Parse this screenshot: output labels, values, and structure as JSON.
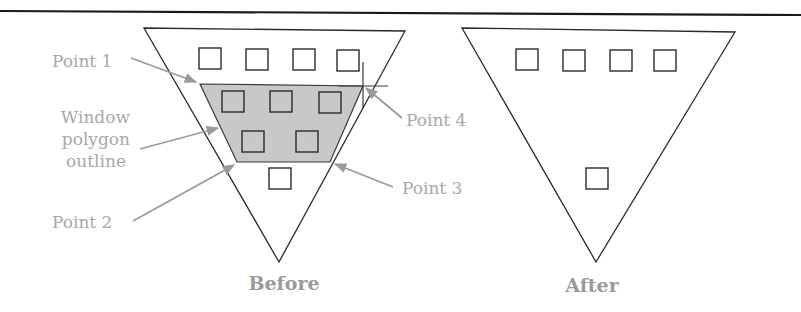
{
  "diagram": {
    "type": "polygon-window-selection",
    "colors": {
      "outline": "#2a2a2a",
      "window_fill": "#c8c8c8",
      "label_text": "#a8a8a8",
      "leader_arrow": "#9a9a9a",
      "top_rule": "#1a1a1a"
    },
    "before": {
      "caption": "Before",
      "labels": {
        "point1": "Point 1",
        "window_line1": "Window",
        "window_line2": "polygon",
        "window_line3": "outline",
        "point2": "Point 2",
        "point3": "Point 3",
        "point4": "Point 4"
      },
      "square_count_total": 10,
      "squares_inside_window": 5
    },
    "after": {
      "caption": "After",
      "square_count_total": 5
    }
  }
}
